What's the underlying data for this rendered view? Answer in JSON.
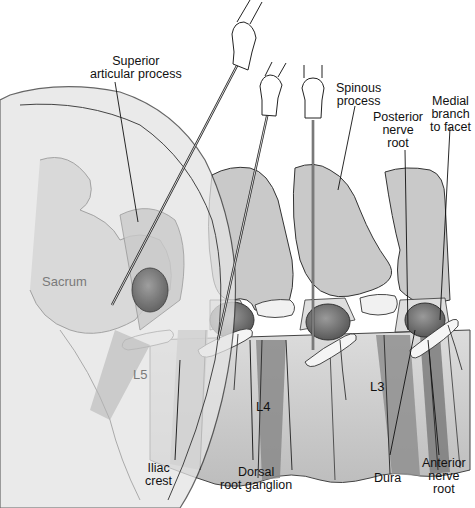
{
  "figure": {
    "vertebra_labels": [
      "Sacrum",
      "L5",
      "L4",
      "L3"
    ],
    "needles": 3,
    "labels": {
      "superior_articular_process": "Superior\narticular process",
      "spinous_process": "Spinous\nprocess",
      "posterior_nerve_root": "Posterior\nnerve\nroot",
      "medial_branch": "Medial\nbranch\nto facet",
      "sacrum": "Sacrum",
      "l5": "L5",
      "l4": "L4",
      "l3": "L3",
      "iliac_crest": "Iliac\ncrest",
      "dorsal_root_ganglion": "Dorsal\nroot ganglion",
      "dura": "Dura",
      "anterior_nerve_root": "Anterior\nnerve\nroot"
    },
    "colors": {
      "bone_light": "#e6e6e6",
      "bone_mid": "#cfcfcf",
      "bone_dark": "#a9a9a9",
      "body_dark": "#7d7d7d",
      "ganglion": "#6a6a6a",
      "nerve": "#f4f4f4",
      "outline": "#333333"
    }
  }
}
